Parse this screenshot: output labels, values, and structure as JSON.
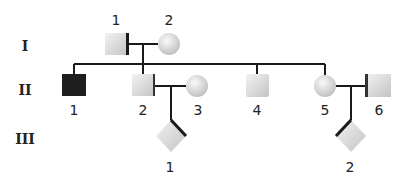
{
  "diagram": {
    "type": "pedigree",
    "generations": [
      {
        "label": "I"
      },
      {
        "label": "II"
      },
      {
        "label": "III"
      }
    ],
    "individuals": {
      "I-1": {
        "number": "1",
        "shape": "square",
        "sex": "male",
        "affected": false
      },
      "I-2": {
        "number": "2",
        "shape": "circle",
        "sex": "female",
        "affected": false
      },
      "II-1": {
        "number": "1",
        "shape": "square",
        "sex": "male",
        "affected": true
      },
      "II-2": {
        "number": "2",
        "shape": "square",
        "sex": "male",
        "affected": false
      },
      "II-3": {
        "number": "3",
        "shape": "circle",
        "sex": "female",
        "affected": false
      },
      "II-4": {
        "number": "4",
        "shape": "square",
        "sex": "male",
        "affected": false
      },
      "II-5": {
        "number": "5",
        "shape": "circle",
        "sex": "female",
        "affected": false
      },
      "II-6": {
        "number": "6",
        "shape": "square",
        "sex": "male",
        "affected": false
      },
      "III-1": {
        "number": "1",
        "shape": "diamond",
        "sex": "unknown",
        "affected": false
      },
      "III-2": {
        "number": "2",
        "shape": "diamond",
        "sex": "unknown",
        "affected": false
      }
    },
    "matings": [
      {
        "partners": [
          "I-1",
          "I-2"
        ],
        "children": [
          "II-1",
          "II-2",
          "II-4",
          "II-5"
        ]
      },
      {
        "partners": [
          "II-2",
          "II-3"
        ],
        "children": [
          "III-1"
        ]
      },
      {
        "partners": [
          "II-5",
          "II-6"
        ],
        "children": [
          "III-2"
        ]
      }
    ],
    "colors": {
      "affected": "#1e1e1e",
      "unaffected": "#d6d6d6",
      "line": "#1a1a1a"
    }
  }
}
